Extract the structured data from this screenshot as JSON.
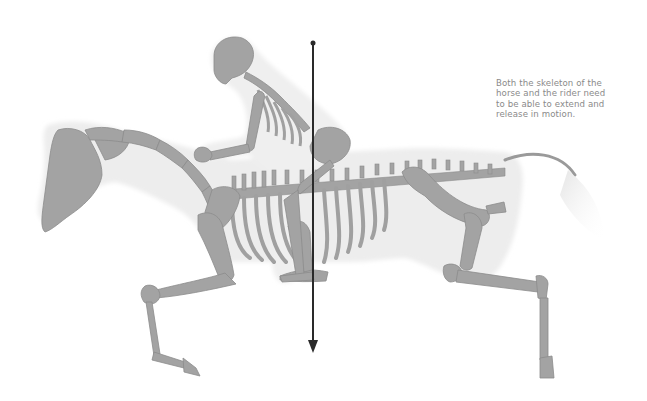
{
  "figure": {
    "caption_lines": [
      "Both the skeleton of the",
      "horse and the rider need",
      "to be able to extend and",
      "release in motion."
    ],
    "gravity_line": {
      "label": "line-of-gravity",
      "x": 313,
      "y_top": 43,
      "y_bottom": 352
    },
    "colors": {
      "background": "#ffffff",
      "body_silhouette": "#ececec",
      "bone": "#a3a3a3",
      "bone_outline": "#8c8c8c",
      "gravity_line": "#2a2a2a",
      "caption_text": "#8a8a8a"
    }
  }
}
